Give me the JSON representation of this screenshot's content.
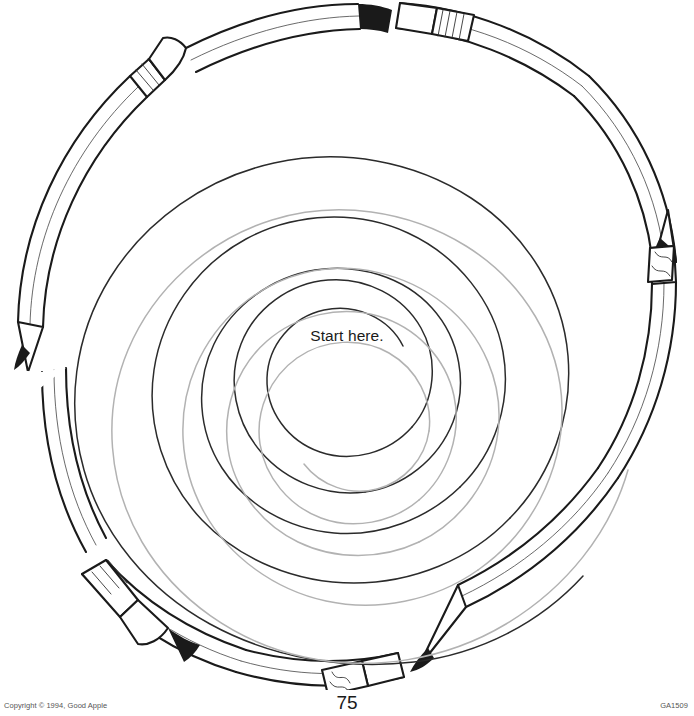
{
  "page": {
    "page_number": "75",
    "background_color": "#ffffff"
  },
  "maze": {
    "start_label": "Start here.",
    "dark_path_color": "#2b2b2b",
    "light_path_color": "#b0b0b0",
    "outline_color": "#1a1a1a",
    "spiral_turns": 5,
    "border_type": "pencil-ring",
    "pencil_count": 8,
    "pencil_parts": [
      "sharpened-tip",
      "wood-barrel",
      "ferrule-band",
      "eraser"
    ]
  },
  "footer": {
    "copyright": "Copyright © 1994, Good Apple",
    "code": "GA1509"
  }
}
